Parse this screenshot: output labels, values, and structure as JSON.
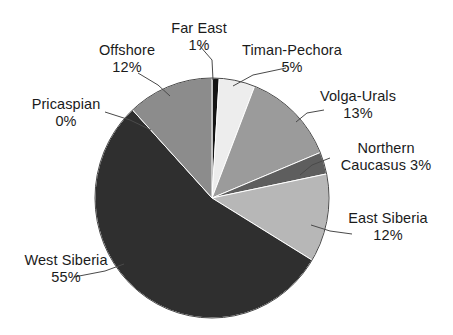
{
  "chart_data": {
    "type": "pie",
    "title": "",
    "subtitle": "",
    "xlabel": "",
    "ylabel": "",
    "grid": false,
    "legend": "none (direct labels with leader lines)",
    "labels_format": "name on first line, percentage on second line",
    "total_percent": "101",
    "start_angle_deg": 0,
    "direction": "clockwise",
    "categories": [
      "Far East",
      "Timan-Pechora",
      "Volga-Urals",
      "Northern Caucasus",
      "East Siberia",
      "West Siberia",
      "Pricaspian",
      "Offshore"
    ],
    "values": [
      1,
      5,
      13,
      3,
      12,
      55,
      0,
      12
    ],
    "value_labels": [
      "1%",
      "5%",
      "13%",
      "3%",
      "12%",
      "55%",
      "0%",
      "12%"
    ],
    "colors": [
      "#151515",
      "#ededed",
      "#9b9b9b",
      "#5e5e5e",
      "#b7b7b7",
      "#2f2f2f",
      "#777777",
      "#8c8c8c"
    ],
    "slices": [
      {
        "name": "Far East",
        "value": 1,
        "value_label": "1%",
        "color": "#151515"
      },
      {
        "name": "Timan-Pechora",
        "value": 5,
        "value_label": "5%",
        "color": "#ededed"
      },
      {
        "name": "Volga-Urals",
        "value": 13,
        "value_label": "13%",
        "color": "#9b9b9b"
      },
      {
        "name": "Northern Caucasus",
        "value": 3,
        "value_label": "3%",
        "color": "#5e5e5e"
      },
      {
        "name": "East Siberia",
        "value": 12,
        "value_label": "12%",
        "color": "#b7b7b7"
      },
      {
        "name": "West Siberia",
        "value": 55,
        "value_label": "55%",
        "color": "#2f2f2f"
      },
      {
        "name": "Pricaspian",
        "value": 0,
        "value_label": "0%",
        "color": "#777777"
      },
      {
        "name": "Offshore",
        "value": 12,
        "value_label": "12%",
        "color": "#8c8c8c"
      }
    ]
  },
  "labels": {
    "far_east": {
      "name": "Far East",
      "value": "1%"
    },
    "timan_pechora": {
      "name": "Timan-Pechora",
      "value": "5%"
    },
    "volga_urals": {
      "name": "Volga-Urals",
      "value": "13%"
    },
    "northern_caucasus": {
      "name": "Northern",
      "value": "Caucasus 3%"
    },
    "east_siberia": {
      "name": "East Siberia",
      "value": "12%"
    },
    "west_siberia": {
      "name": "West Siberia",
      "value": "55%"
    },
    "pricaspian": {
      "name": "Pricaspian",
      "value": "0%"
    },
    "offshore": {
      "name": "Offshore",
      "value": "12%"
    }
  },
  "style": {
    "background": "#ffffff",
    "text_color": "#1b1b1b",
    "leader_line_color": "#4a4a4a",
    "slice_outline": "#ffffff"
  }
}
